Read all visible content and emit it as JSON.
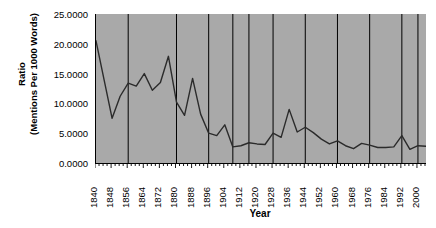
{
  "chart_data": {
    "type": "line",
    "title": "",
    "xlabel": "Year",
    "ylabel_line1": "Ratio",
    "ylabel_line2": "(Mentions Per 1000 Words)",
    "ylim": [
      0,
      25
    ],
    "ytick_labels": [
      "25.0000",
      "20.0000",
      "15.0000",
      "10.0000",
      "5.0000",
      "0.0000"
    ],
    "ytick_values": [
      25,
      20,
      15,
      10,
      5,
      0
    ],
    "xlim": [
      1840,
      2004
    ],
    "xtick_labels": [
      "1840",
      "1848",
      "1856",
      "1864",
      "1872",
      "1880",
      "1888",
      "1896",
      "1904",
      "1912",
      "1920",
      "1928",
      "1936",
      "1944",
      "1952",
      "1960",
      "1968",
      "1976",
      "1984",
      "1992",
      "2000"
    ],
    "xtick_values": [
      1840,
      1848,
      1856,
      1864,
      1872,
      1880,
      1888,
      1896,
      1904,
      1912,
      1920,
      1928,
      1936,
      1944,
      1952,
      1960,
      1968,
      1976,
      1984,
      1992,
      2000
    ],
    "minor_tick_step": 2,
    "grid": "vertical-only",
    "gridline_years": [
      1856,
      1880,
      1896,
      1908,
      1916,
      1928,
      1944,
      1960,
      1976,
      1992,
      2000
    ],
    "legend": "none",
    "plot_background": "#a9a9a9",
    "line_color": "#2b2b2b",
    "series": [
      {
        "name": "Ratio (Mentions Per 1000 Words)",
        "x": [
          1840,
          1844,
          1848,
          1852,
          1856,
          1860,
          1864,
          1868,
          1872,
          1876,
          1880,
          1884,
          1888,
          1892,
          1896,
          1900,
          1904,
          1908,
          1912,
          1916,
          1920,
          1924,
          1928,
          1932,
          1936,
          1940,
          1944,
          1948,
          1952,
          1956,
          1960,
          1964,
          1968,
          1972,
          1976,
          1980,
          1984,
          1988,
          1992,
          1996,
          2000,
          2004
        ],
        "y": [
          20.5,
          14.0,
          7.5,
          11.2,
          13.4,
          12.9,
          15.0,
          12.2,
          13.5,
          17.9,
          10.2,
          8.0,
          14.2,
          8.2,
          5.0,
          4.6,
          6.4,
          2.7,
          2.9,
          3.4,
          3.2,
          3.1,
          5.0,
          4.3,
          9.0,
          5.2,
          6.0,
          5.1,
          4.0,
          3.2,
          3.7,
          2.9,
          2.4,
          3.3,
          3.0,
          2.6,
          2.6,
          2.7,
          4.6,
          2.3,
          2.9,
          2.8
        ]
      }
    ]
  }
}
